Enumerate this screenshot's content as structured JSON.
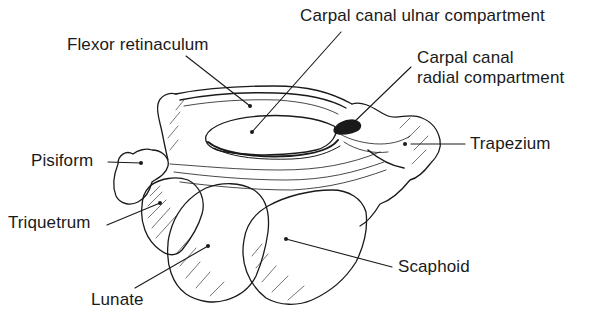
{
  "figure": {
    "labels": {
      "flexor_retinaculum": "Flexor retinaculum",
      "ulnar_compartment": "Carpal canal ulnar compartment",
      "radial_compartment_line1": "Carpal canal",
      "radial_compartment_line2": "radial compartment",
      "trapezium": "Trapezium",
      "pisiform": "Pisiform",
      "triquetrum": "Triquetrum",
      "scaphoid": "Scaphoid",
      "lunate": "Lunate"
    },
    "colors": {
      "ink": "#1a1a1a",
      "background": "#ffffff"
    }
  }
}
